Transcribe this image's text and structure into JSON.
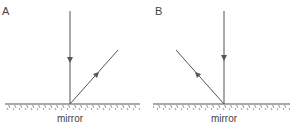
{
  "panels": [
    {
      "label": "A",
      "mirror_label": "mirror",
      "reflected_direction": "upper-right"
    },
    {
      "label": "B",
      "mirror_label": "mirror",
      "reflected_direction": "upper-left"
    }
  ],
  "colors": {
    "line": "#555555",
    "text": "#444444"
  }
}
